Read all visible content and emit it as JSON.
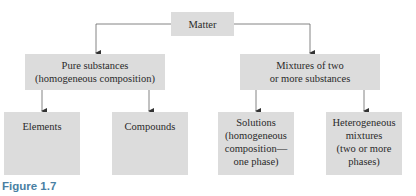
{
  "diagram": {
    "root": {
      "label": "Matter"
    },
    "level2": [
      {
        "line1": "Pure substances",
        "line2": "(homogeneous composition)"
      },
      {
        "line1": "Mixtures of two",
        "line2": "or more substances"
      }
    ],
    "level3": [
      {
        "lines": [
          "Elements"
        ]
      },
      {
        "lines": [
          "Compounds"
        ]
      },
      {
        "lines": [
          "Solutions",
          "(homogeneous",
          "composition—",
          "one phase)"
        ]
      },
      {
        "lines": [
          "Heterogeneous",
          "mixtures",
          "(two or more",
          "phases)"
        ]
      }
    ],
    "box_color": "#dcdcdc",
    "line_color": "#555555"
  },
  "caption": "Figure 1.7"
}
